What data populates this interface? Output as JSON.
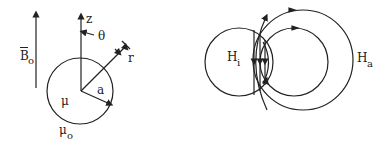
{
  "colors": {
    "ink": "#222222",
    "background": "#ffffff"
  },
  "left_figure": {
    "field_label": "B",
    "field_subscript": "o",
    "axis_label": "z",
    "angle_label": "θ",
    "radial_label": "r",
    "radius_label": "a",
    "inner_permeability": "μ",
    "outer_permeability_symbol": "μ",
    "outer_permeability_subscript": "o"
  },
  "right_figure": {
    "inner_field_symbol": "H",
    "inner_field_subscript": "i",
    "outer_field_symbol": "H",
    "outer_field_subscript": "a"
  }
}
